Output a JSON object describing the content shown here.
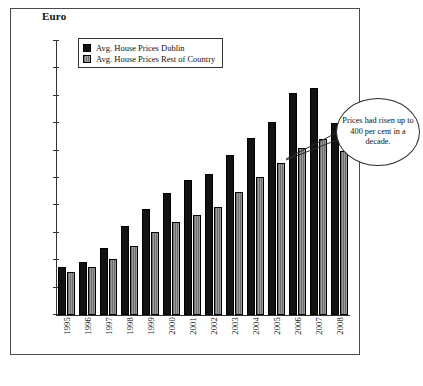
{
  "figure": {
    "axis_unit_title": "Euro"
  },
  "legend": {
    "items": [
      {
        "label": "Avg. House Prices Dublin",
        "swatch": "black-square-icon",
        "color": "#121212"
      },
      {
        "label": "Avg. House Prices Rest of Country",
        "swatch": "gray-striped-square-icon",
        "color": "#9a9a9a"
      }
    ]
  },
  "callout": {
    "text": "Prices had risen up to 400 per cent in a decade."
  },
  "chart_data": {
    "type": "bar",
    "title": "",
    "xlabel": "",
    "ylabel": "Euro",
    "ylim": [
      0,
      500000
    ],
    "yticks": [
      0,
      50000,
      100000,
      150000,
      200000,
      250000,
      300000,
      350000,
      400000,
      450000,
      500000
    ],
    "ytick_labels": [
      "0",
      "50,000",
      "100,000",
      "150,000",
      "200,000",
      "250,000",
      "300,000",
      "350,000",
      "400,000",
      "450,000",
      "500,000"
    ],
    "grid": false,
    "legend_position": "top-left-inside",
    "categories": [
      "1995",
      "1996",
      "1997",
      "1998",
      "1999",
      "2000",
      "2001",
      "2002",
      "2003",
      "2004",
      "2005",
      "2006",
      "2007",
      "2008"
    ],
    "series": [
      {
        "name": "Avg. House Prices Dublin",
        "color": "#121212",
        "values": [
          87000,
          97000,
          122000,
          163000,
          194000,
          222000,
          246000,
          258000,
          292000,
          323000,
          353000,
          405000,
          415000,
          350000
        ]
      },
      {
        "name": "Avg. House Prices Rest of Country",
        "color": "#9a9a9a",
        "values": [
          78000,
          87000,
          102000,
          126000,
          151000,
          170000,
          183000,
          197000,
          224000,
          251000,
          277000,
          304000,
          322000,
          300000
        ]
      }
    ],
    "annotations": [
      {
        "text": "Prices had risen up to 400 per cent in a decade.",
        "shape": "ellipse-callout",
        "points_to": "2007"
      }
    ]
  }
}
